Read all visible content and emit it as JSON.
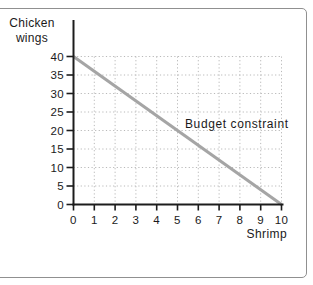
{
  "figure": {
    "ylabel_line1": "Chicken",
    "ylabel_line2": "wings"
  },
  "chart_data": {
    "type": "line",
    "title": "",
    "xlabel": "Shrimp",
    "ylabel": "Chicken wings",
    "annotation": "Budget constraint",
    "x_ticks": [
      0,
      1,
      2,
      3,
      4,
      5,
      6,
      7,
      8,
      9,
      10
    ],
    "y_ticks": [
      0,
      5,
      10,
      15,
      20,
      25,
      30,
      35,
      40
    ],
    "xlim": [
      0,
      10
    ],
    "ylim": [
      0,
      40
    ],
    "grid": true,
    "grid_style": "dotted",
    "legend": "none",
    "series": [
      {
        "name": "Budget constraint",
        "points": [
          [
            0,
            40
          ],
          [
            10,
            0
          ]
        ],
        "color": "#a5a5a5"
      }
    ],
    "colors": {
      "axis": "#1c1c1c",
      "grid": "#b9b9b9",
      "line": "#a5a5a5",
      "frame_border": "#909090",
      "text": "#1a1a1a",
      "background": "#ffffff"
    }
  }
}
